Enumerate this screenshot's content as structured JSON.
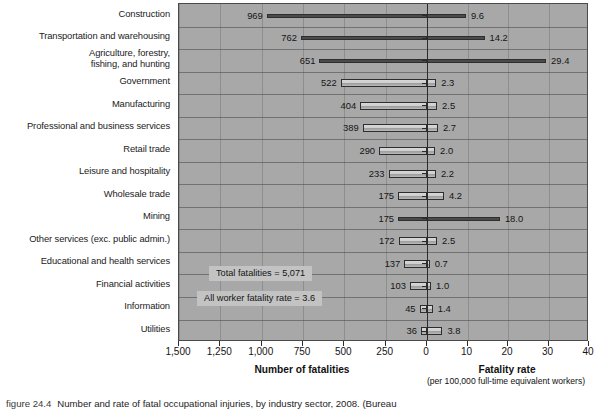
{
  "figure": {
    "number_label": "figure 24.4",
    "caption": "Number and rate of fatal occupational injuries, by industry sector, 2008. (Bureau"
  },
  "axes": {
    "left_title": "Number of fatalities",
    "right_title": "Fatality rate",
    "right_subtitle": "(per 100,000 full-time equivalent\nworkers)",
    "left_ticks": [
      "1,500",
      "1,250",
      "1,000",
      "750",
      "500",
      "250",
      "0"
    ],
    "right_ticks": [
      "10",
      "20",
      "30",
      "40"
    ]
  },
  "annotations": [
    {
      "text": "Total fatalities = 5,071"
    },
    {
      "text": "All worker fatality rate = 3.6"
    }
  ],
  "chart_data": {
    "type": "bar",
    "title": "Number and rate of fatal occupational injuries, by industry sector, 2008",
    "orientation": "horizontal",
    "layout": "butterfly",
    "xlabel_left": "Number of fatalities",
    "xlabel_right": "Fatality rate",
    "xlabel_right_note": "per 100,000 full-time equivalent workers",
    "ylabel": "",
    "grid": true,
    "legend": "none",
    "left_axis": {
      "ticks": [
        1500,
        1250,
        1000,
        750,
        500,
        250,
        0
      ],
      "range": [
        1500,
        0
      ],
      "direction": "reversed"
    },
    "right_axis": {
      "ticks": [
        0,
        10,
        20,
        30,
        40
      ],
      "range": [
        0,
        40
      ]
    },
    "categories": [
      "Construction",
      "Transportation and warehousing",
      "Agriculture, forestry, fishing, and hunting",
      "Government",
      "Manufacturing",
      "Professional and business services",
      "Retail trade",
      "Leisure and hospitality",
      "Wholesale trade",
      "Mining",
      "Other services (exc. public admin.)",
      "Educational and health services",
      "Financial activities",
      "Information",
      "Utilities"
    ],
    "series": [
      {
        "name": "Number of fatalities",
        "side": "left",
        "values": [
          969,
          762,
          651,
          522,
          404,
          389,
          290,
          233,
          175,
          175,
          172,
          137,
          103,
          45,
          36
        ]
      },
      {
        "name": "Fatality rate",
        "side": "right",
        "values": [
          9.6,
          14.2,
          29.4,
          2.3,
          2.5,
          2.7,
          2.0,
          2.2,
          4.2,
          18.0,
          2.5,
          0.7,
          1.0,
          1.4,
          3.8
        ]
      }
    ],
    "annotations": [
      "Total fatalities = 5,071",
      "All worker fatality rate = 3.6"
    ],
    "totals": {
      "total_fatalities": 5071,
      "all_worker_fatality_rate": 3.6
    }
  },
  "rows": [
    {
      "label": "Construction",
      "label_lines": "Construction",
      "fatalities": "969",
      "rate": "9.6",
      "fat_num": 969,
      "rate_num": 9.6,
      "thin": true
    },
    {
      "label": "Transportation and warehousing",
      "label_lines": "Transportation and warehousing",
      "fatalities": "762",
      "rate": "14.2",
      "fat_num": 762,
      "rate_num": 14.2,
      "thin": true
    },
    {
      "label": "Agriculture, forestry, fishing, and hunting",
      "label_lines": "Agriculture, forestry,\nfishing, and hunting",
      "fatalities": "651",
      "rate": "29.4",
      "fat_num": 651,
      "rate_num": 29.4,
      "thin": true
    },
    {
      "label": "Government",
      "label_lines": "Government",
      "fatalities": "522",
      "rate": "2.3",
      "fat_num": 522,
      "rate_num": 2.3,
      "thin": false
    },
    {
      "label": "Manufacturing",
      "label_lines": "Manufacturing",
      "fatalities": "404",
      "rate": "2.5",
      "fat_num": 404,
      "rate_num": 2.5,
      "thin": false
    },
    {
      "label": "Professional and business services",
      "label_lines": "Professional and business services",
      "fatalities": "389",
      "rate": "2.7",
      "fat_num": 389,
      "rate_num": 2.7,
      "thin": false
    },
    {
      "label": "Retail trade",
      "label_lines": "Retail trade",
      "fatalities": "290",
      "rate": "2.0",
      "fat_num": 290,
      "rate_num": 2.0,
      "thin": false
    },
    {
      "label": "Leisure and hospitality",
      "label_lines": "Leisure and hospitality",
      "fatalities": "233",
      "rate": "2.2",
      "fat_num": 233,
      "rate_num": 2.2,
      "thin": false
    },
    {
      "label": "Wholesale trade",
      "label_lines": "Wholesale trade",
      "fatalities": "175",
      "rate": "4.2",
      "fat_num": 175,
      "rate_num": 4.2,
      "thin": false
    },
    {
      "label": "Mining",
      "label_lines": "Mining",
      "fatalities": "175",
      "rate": "18.0",
      "fat_num": 175,
      "rate_num": 18.0,
      "thin": true
    },
    {
      "label": "Other services (exc. public admin.)",
      "label_lines": "Other services (exc. public admin.)",
      "fatalities": "172",
      "rate": "2.5",
      "fat_num": 172,
      "rate_num": 2.5,
      "thin": false
    },
    {
      "label": "Educational and health services",
      "label_lines": "Educational and health services",
      "fatalities": "137",
      "rate": "0.7",
      "fat_num": 137,
      "rate_num": 0.7,
      "thin": false
    },
    {
      "label": "Financial activities",
      "label_lines": "Financial activities",
      "fatalities": "103",
      "rate": "1.0",
      "fat_num": 103,
      "rate_num": 1.0,
      "thin": false
    },
    {
      "label": "Information",
      "label_lines": "Information",
      "fatalities": "45",
      "rate": "1.4",
      "fat_num": 45,
      "rate_num": 1.4,
      "thin": false
    },
    {
      "label": "Utilities",
      "label_lines": "Utilities",
      "fatalities": "36",
      "rate": "3.8",
      "fat_num": 36,
      "rate_num": 3.8,
      "thin": false
    }
  ]
}
